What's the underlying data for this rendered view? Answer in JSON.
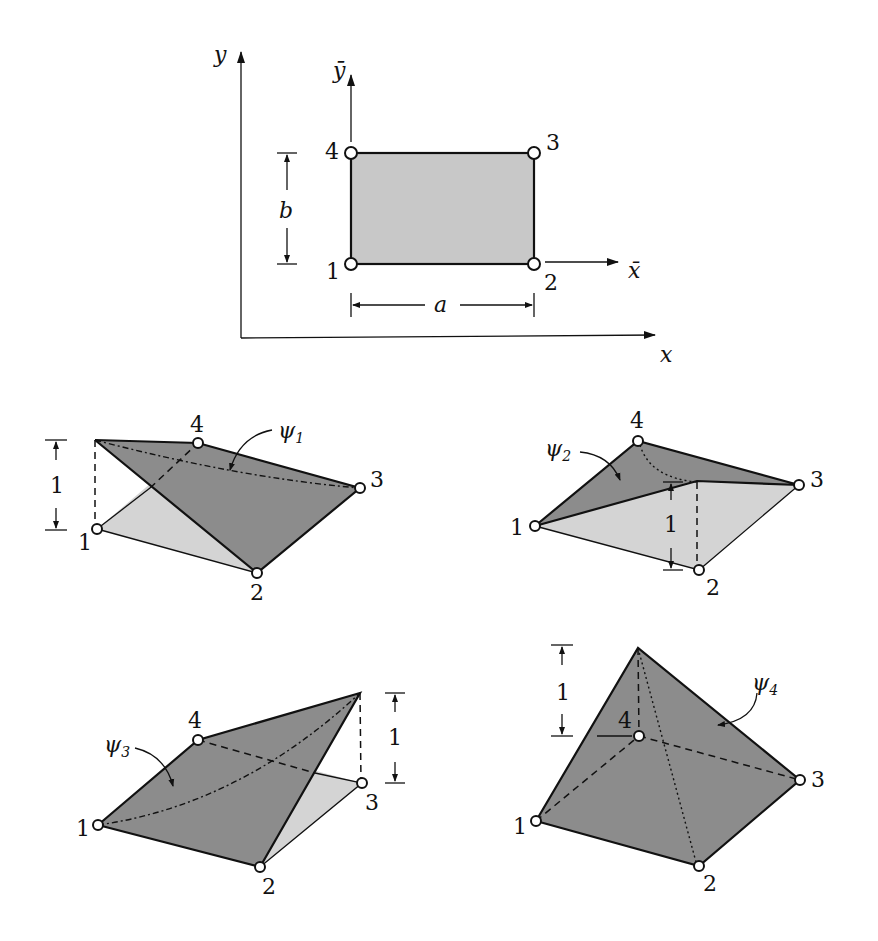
{
  "figure": {
    "element": {
      "axes": {
        "x": "x",
        "y": "y",
        "x_local": "x̄",
        "y_local": "ȳ"
      },
      "nodes": [
        "1",
        "2",
        "3",
        "4"
      ],
      "dimensions": {
        "width": "a",
        "height": "b"
      }
    },
    "shape_functions": [
      {
        "name": "ψ",
        "index": "1",
        "peak_node": "1",
        "height_label": "1",
        "nodes": [
          "1",
          "2",
          "3",
          "4"
        ]
      },
      {
        "name": "ψ",
        "index": "2",
        "peak_node": "2",
        "height_label": "1",
        "nodes": [
          "1",
          "2",
          "3",
          "4"
        ]
      },
      {
        "name": "ψ",
        "index": "3",
        "peak_node": "3",
        "height_label": "1",
        "nodes": [
          "1",
          "2",
          "3",
          "4"
        ]
      },
      {
        "name": "ψ",
        "index": "4",
        "peak_node": "4",
        "height_label": "1",
        "nodes": [
          "1",
          "2",
          "3",
          "4"
        ]
      }
    ]
  }
}
